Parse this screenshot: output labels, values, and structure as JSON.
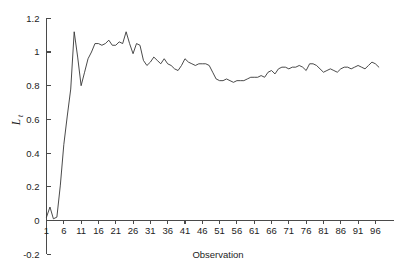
{
  "chart_data": {
    "type": "line",
    "title": "",
    "xlabel": "Observation",
    "ylabel": "L_t",
    "ylabel_base": "L",
    "ylabel_sub": "t",
    "xlim": [
      1,
      100
    ],
    "ylim": [
      -0.2,
      1.2
    ],
    "grid": false,
    "legend": null,
    "line_color": "#363636",
    "axis_color": "#4a4a4a",
    "background_color": "#ffffff",
    "ytick_labels": [
      "1.2",
      "1",
      "0.8",
      "0.6",
      "0.4",
      "0.2",
      "0",
      "-0.2"
    ],
    "ytick_values": [
      1.2,
      1.0,
      0.8,
      0.6,
      0.4,
      0.2,
      0.0,
      -0.2
    ],
    "xtick_labels": [
      "1",
      "6",
      "11",
      "16",
      "21",
      "26",
      "31",
      "36",
      "41",
      "46",
      "51",
      "56",
      "61",
      "66",
      "71",
      "76",
      "81",
      "86",
      "91",
      "96"
    ],
    "xtick_values": [
      1,
      6,
      11,
      16,
      21,
      26,
      31,
      36,
      41,
      46,
      51,
      56,
      61,
      66,
      71,
      76,
      81,
      86,
      91,
      96
    ],
    "series": [
      {
        "name": "Lt",
        "x": [
          1,
          2,
          3,
          4,
          5,
          6,
          7,
          8,
          9,
          10,
          11,
          12,
          13,
          14,
          15,
          16,
          17,
          18,
          19,
          20,
          21,
          22,
          23,
          24,
          25,
          26,
          27,
          28,
          29,
          30,
          31,
          32,
          33,
          34,
          35,
          36,
          37,
          38,
          39,
          40,
          41,
          42,
          43,
          44,
          45,
          46,
          47,
          48,
          49,
          50,
          51,
          52,
          53,
          54,
          55,
          56,
          57,
          58,
          59,
          60,
          61,
          62,
          63,
          64,
          65,
          66,
          67,
          68,
          69,
          70,
          71,
          72,
          73,
          74,
          75,
          76,
          77,
          78,
          79,
          80,
          81,
          82,
          83,
          84,
          85,
          86,
          87,
          88,
          89,
          90,
          91,
          92,
          93,
          94,
          95,
          96,
          97
        ],
        "values": [
          0.02,
          0.08,
          0.01,
          0.02,
          0.21,
          0.45,
          0.62,
          0.78,
          1.12,
          0.97,
          0.8,
          0.88,
          0.96,
          1.0,
          1.05,
          1.05,
          1.04,
          1.05,
          1.07,
          1.04,
          1.04,
          1.06,
          1.05,
          1.12,
          1.05,
          0.99,
          1.05,
          1.04,
          0.95,
          0.92,
          0.94,
          0.97,
          0.95,
          0.93,
          0.96,
          0.93,
          0.92,
          0.9,
          0.89,
          0.92,
          0.96,
          0.94,
          0.93,
          0.92,
          0.93,
          0.93,
          0.93,
          0.92,
          0.88,
          0.84,
          0.83,
          0.83,
          0.84,
          0.83,
          0.82,
          0.83,
          0.83,
          0.83,
          0.84,
          0.85,
          0.85,
          0.85,
          0.86,
          0.85,
          0.88,
          0.89,
          0.87,
          0.9,
          0.91,
          0.91,
          0.9,
          0.91,
          0.91,
          0.92,
          0.91,
          0.89,
          0.93,
          0.93,
          0.92,
          0.9,
          0.88,
          0.89,
          0.9,
          0.89,
          0.88,
          0.9,
          0.91,
          0.91,
          0.9,
          0.91,
          0.92,
          0.91,
          0.9,
          0.92,
          0.94,
          0.93,
          0.91
        ]
      }
    ]
  }
}
